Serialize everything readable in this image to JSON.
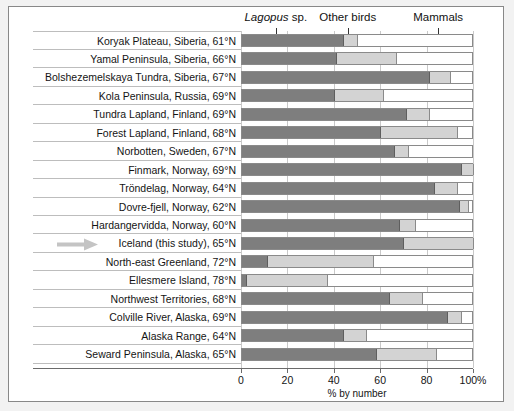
{
  "chart_data": {
    "type": "bar",
    "orientation": "horizontal",
    "stacked": true,
    "title": "",
    "xlabel": "% by number",
    "ylabel": "",
    "xlim": [
      0,
      100
    ],
    "xticks": [
      0,
      20,
      40,
      60,
      80,
      100
    ],
    "xticklabels": [
      "0",
      "20",
      "40",
      "60",
      "80",
      "100%"
    ],
    "grid": "vertical",
    "legend_position": "top",
    "legend": [
      {
        "name": "Lagopus sp.",
        "italic_part": "Lagopus",
        "plain_part": " sp.",
        "color": "#7e7e7e",
        "pointer_pct": 15
      },
      {
        "name": "Other birds",
        "italic_part": "",
        "plain_part": "Other birds",
        "color": "#d3d3d3",
        "pointer_pct": 46
      },
      {
        "name": "Mammals",
        "italic_part": "",
        "plain_part": "Mammals",
        "color": "#ffffff",
        "pointer_pct": 85
      }
    ],
    "categories": [
      "Koryak Plateau, Siberia, 61°N",
      "Yamal Peninsula, Siberia, 66°N",
      "Bolshezemelskaya Tundra, Siberia, 67°N",
      "Kola Peninsula, Russia, 69°N",
      "Tundra Lapland, Finland, 69°N",
      "Forest Lapland, Finland, 68°N",
      "Norbotten, Sweden, 67°N",
      "Finmark, Norway, 69°N",
      "Tröndelag, Norway, 64°N",
      "Dovre-fjell, Norway, 62°N",
      "Hardangervidda, Norway, 60°N",
      "Iceland (this study), 65°N",
      "North-east Greenland, 72°N",
      "Ellesmere Island, 78°N",
      "Northwest Territories, 68°N",
      "Colville River, Alaska, 69°N",
      "Alaska Range, 64°N",
      "Seward Peninsula, Alaska, 65°N"
    ],
    "series": [
      {
        "name": "Lagopus sp.",
        "color": "#7e7e7e",
        "values": [
          44,
          41,
          81,
          40,
          71,
          60,
          66,
          95,
          83,
          94,
          68,
          70,
          11,
          2,
          64,
          89,
          44,
          58
        ]
      },
      {
        "name": "Other birds",
        "color": "#d3d3d3",
        "values": [
          6,
          26,
          9,
          21,
          10,
          33,
          6,
          5,
          10,
          4,
          7,
          30,
          46,
          35,
          14,
          6,
          10,
          26
        ]
      },
      {
        "name": "Mammals",
        "color": "#ffffff",
        "values": [
          50,
          33,
          10,
          39,
          19,
          7,
          28,
          0,
          7,
          2,
          25,
          0,
          43,
          63,
          22,
          5,
          46,
          16
        ]
      }
    ],
    "annotations": [
      {
        "type": "arrow",
        "target_category": "Iceland (this study), 65°N",
        "direction": "right",
        "color": "#c4c4c4"
      }
    ]
  }
}
